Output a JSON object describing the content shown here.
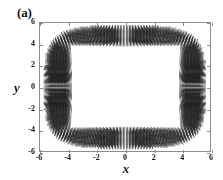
{
  "panel": {
    "label": "(a)"
  },
  "axes": {
    "x_title": "x",
    "y_title": "y",
    "x_ticks": [
      "-6",
      "-4",
      "-2",
      "0",
      "2",
      "4",
      "6"
    ],
    "y_ticks": [
      "6",
      "4",
      "2",
      "0",
      "-2",
      "-4",
      "-6"
    ],
    "frame_color": "#8c8c8c",
    "text_color": "#111111"
  },
  "chart_data": {
    "type": "scatter",
    "title": "(a)",
    "xlabel": "x",
    "ylabel": "y",
    "xlim": [
      -6,
      6
    ],
    "ylim": [
      -6,
      6
    ],
    "xticks": [
      -6,
      -4,
      -2,
      0,
      2,
      4,
      6
    ],
    "yticks": [
      -6,
      -4,
      -2,
      0,
      2,
      4,
      6
    ],
    "grid": false,
    "legend": null,
    "annotations": [
      "(a)"
    ],
    "series": [
      {
        "name": "vector-field-band",
        "marker": "line-segment",
        "color": "#1a1a1a",
        "inner_boundary": {
          "shape": "rectangle",
          "x_half_width": 4.0,
          "y_half_height": 4.0
        },
        "outer_boundary": {
          "shape": "superellipse",
          "x_half_width": 5.5,
          "y_half_height": 5.6,
          "exponent": 4.0
        },
        "segment_count": 2600,
        "segment_length": 0.55,
        "orientation": "radial"
      }
    ]
  }
}
